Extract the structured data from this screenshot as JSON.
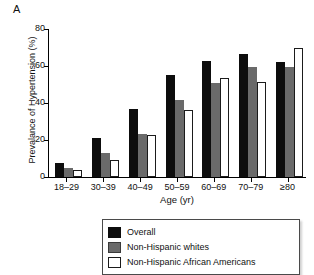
{
  "figure": {
    "panel_label": "A"
  },
  "chart_data": {
    "type": "bar",
    "title": "",
    "subtitle": "",
    "xlabel": "Age (yr)",
    "ylabel": "Prevalance of Hypertension (%)",
    "categories": [
      "18–29",
      "30–39",
      "40–49",
      "50–59",
      "60–69",
      "70–79",
      "≥80"
    ],
    "series": [
      {
        "name": "Overall",
        "color": "#0d0d0d",
        "values": [
          7.5,
          21.0,
          37.0,
          55.0,
          62.5,
          66.5,
          62.0
        ]
      },
      {
        "name": "Non-Hispanic whites",
        "color": "#6a6a6a",
        "values": [
          5.0,
          13.0,
          23.5,
          41.5,
          51.0,
          59.5,
          59.5
        ]
      },
      {
        "name": "Non-Hispanic African Americans",
        "color": "#ffffff",
        "values": [
          3.8,
          9.0,
          22.5,
          36.0,
          53.5,
          51.5,
          70.0
        ]
      }
    ],
    "ylim": [
      0,
      80
    ],
    "yticks": [
      0,
      20,
      40,
      60,
      80
    ],
    "ytick_labels": [
      "0",
      "20",
      "40",
      "60",
      "80"
    ],
    "grid": false,
    "legend_position": "bottom-center"
  },
  "legend": {
    "items": [
      {
        "label": "Overall",
        "swatch": "black-filled-swatch"
      },
      {
        "label": "Non-Hispanic whites",
        "swatch": "gray-filled-swatch"
      },
      {
        "label": "Non-Hispanic African Americans",
        "swatch": "white-outlined-swatch"
      }
    ]
  }
}
